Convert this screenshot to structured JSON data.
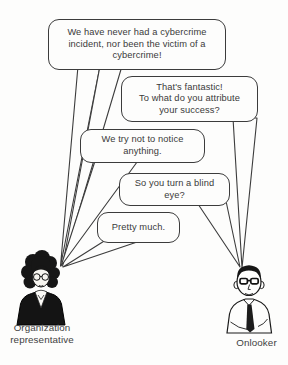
{
  "scene": {
    "type": "cartoon",
    "background_color": "#fdfdfc",
    "ink_color": "#3c3c3c",
    "fill_black": "#161616"
  },
  "bubbles": [
    {
      "id": "bubble-1",
      "speaker": "organization-representative",
      "lines": [
        "We have never had a cybercrime",
        "incident, nor been the victim of a",
        "cybercrime!"
      ]
    },
    {
      "id": "bubble-2",
      "speaker": "onlooker",
      "lines": [
        "That's fantastic!",
        "To what do you attribute",
        "your success?"
      ]
    },
    {
      "id": "bubble-3",
      "speaker": "organization-representative",
      "lines": [
        "We try not to notice",
        "anything."
      ]
    },
    {
      "id": "bubble-4",
      "speaker": "onlooker",
      "lines": [
        "So you turn a blind",
        "eye?"
      ]
    },
    {
      "id": "bubble-5",
      "speaker": "organization-representative",
      "lines": [
        "Pretty much."
      ]
    }
  ],
  "figures": [
    {
      "id": "organization-representative",
      "label_lines": [
        "Organization",
        "representative"
      ]
    },
    {
      "id": "onlooker",
      "label_lines": [
        "Onlooker"
      ]
    }
  ]
}
